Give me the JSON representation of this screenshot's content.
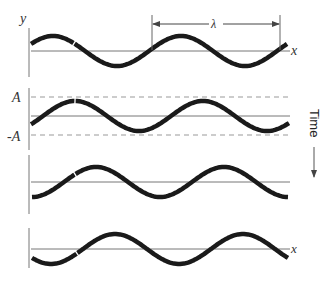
{
  "diagram": {
    "labels": {
      "y_axis": "y",
      "x_axis": "x",
      "wavelength": "λ",
      "amplitude_pos": "A",
      "amplitude_neg": "-A",
      "time": "Time"
    },
    "colors": {
      "wave": "#1a1a1a",
      "axis": "#777777",
      "dashed": "#999999",
      "marker": "#ffffff"
    },
    "wave": {
      "amplitude_px": 15,
      "wavelength_px": 128
    },
    "panels": [
      {
        "id": 1,
        "baseline_y": 51,
        "peak_x": 53,
        "x_start": 31,
        "x_end": 287,
        "axis_top": 28,
        "axis_bottom": 77,
        "marker_x": 74,
        "show_wavelength": true,
        "show_x_label": true
      },
      {
        "id": 2,
        "baseline_y": 116,
        "peak_x": 75,
        "x_start": 31,
        "x_end": 290,
        "axis_top": 88,
        "axis_bottom": 150,
        "marker_x": 75,
        "show_amplitude": true
      },
      {
        "id": 3,
        "baseline_y": 182,
        "peak_x": 96,
        "x_start": 32,
        "x_end": 289,
        "axis_top": 155,
        "axis_bottom": 214,
        "marker_x": 75
      },
      {
        "id": 4,
        "baseline_y": 249,
        "peak_x": 115,
        "x_start": 32,
        "x_end": 289,
        "axis_top": 228,
        "axis_bottom": 268,
        "marker_x": 77,
        "show_x_label": true
      }
    ]
  }
}
